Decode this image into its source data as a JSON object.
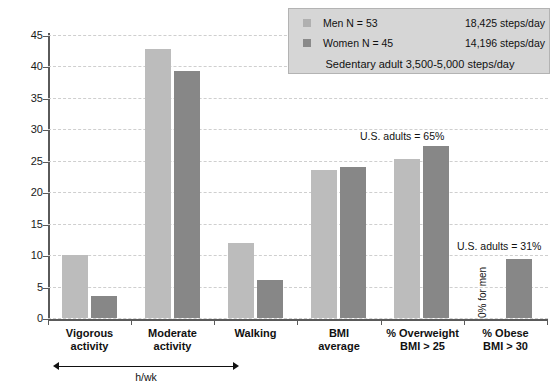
{
  "chart_data": {
    "type": "bar",
    "title": "",
    "subtitle": "",
    "xlabel": "h/wk",
    "ylabel": "",
    "ylim": [
      0,
      45
    ],
    "yticks": [
      0,
      5,
      10,
      15,
      20,
      25,
      30,
      35,
      40,
      45
    ],
    "grid": true,
    "legend_position": "top-right",
    "categories": [
      "Vigorous activity",
      "Moderate activity",
      "Walking",
      "BMI average",
      "% Overweight BMI > 25",
      "% Obese BMI > 30"
    ],
    "category_lines": [
      [
        "Vigorous",
        "activity"
      ],
      [
        "Moderate",
        "activity"
      ],
      [
        "Walking",
        ""
      ],
      [
        "BMI",
        "average"
      ],
      [
        "% Overweight",
        "BMI > 25"
      ],
      [
        "% Obese",
        "BMI > 30"
      ]
    ],
    "series": [
      {
        "name": "Men N = 53",
        "color": "#bcbcbc",
        "values": [
          10.0,
          42.8,
          12.0,
          23.5,
          25.3,
          0.0
        ]
      },
      {
        "name": "Women N = 45",
        "color": "#878787",
        "values": [
          3.5,
          39.2,
          6.0,
          24.0,
          27.3,
          9.4
        ]
      }
    ],
    "annotations": [
      {
        "text": "U.S. adults = 65%",
        "target": "% Overweight BMI > 25"
      },
      {
        "text": "U.S. adults = 31%",
        "target": "% Obese BMI > 30"
      },
      {
        "text": "0% for men",
        "target": "% Obese BMI > 30",
        "orientation": "vertical"
      }
    ],
    "axis_bracket": {
      "label": "h/wk",
      "spans": [
        "Vigorous activity",
        "Moderate activity",
        "Walking"
      ]
    }
  },
  "legend": {
    "rows": [
      {
        "label": "Men N = 53",
        "value": "18,425 steps/day",
        "swatch": "men"
      },
      {
        "label": "Women N = 45",
        "value": "14,196 steps/day",
        "swatch": "women"
      }
    ],
    "footer": "Sedentary adult 3,500-5,000 steps/day"
  },
  "colors": {
    "men_bar": "#bcbcbc",
    "women_bar": "#878787",
    "axis": "#5a5a5a",
    "gridline": "#cfcfcf",
    "legend_background": "#d6d6d6"
  }
}
